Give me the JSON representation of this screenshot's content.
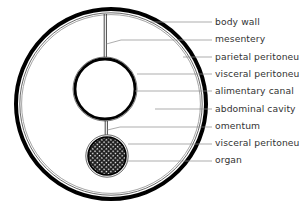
{
  "diagram": {
    "type": "anatomical cross-section",
    "labels": [
      {
        "id": "body-wall",
        "text": "body wall",
        "y": 22
      },
      {
        "id": "mesentery",
        "text": "mesentery",
        "y": 39
      },
      {
        "id": "parietal-peritoneum",
        "text": "parietal peritoneum",
        "y": 57
      },
      {
        "id": "visceral-peritoneum-upper",
        "text": "visceral peritoneum",
        "y": 74
      },
      {
        "id": "alimentary-canal",
        "text": "alimentary canal",
        "y": 91
      },
      {
        "id": "abdominal-cavity",
        "text": "abdominal cavity",
        "y": 109
      },
      {
        "id": "omentum",
        "text": "omentum",
        "y": 126
      },
      {
        "id": "visceral-peritoneum-lower",
        "text": "visceral peritoneum",
        "y": 143
      },
      {
        "id": "organ",
        "text": "organ",
        "y": 160
      }
    ],
    "colors": {
      "stroke": "#000000",
      "leader": "#8a8a8a",
      "text": "#333333",
      "background": "#ffffff"
    }
  }
}
